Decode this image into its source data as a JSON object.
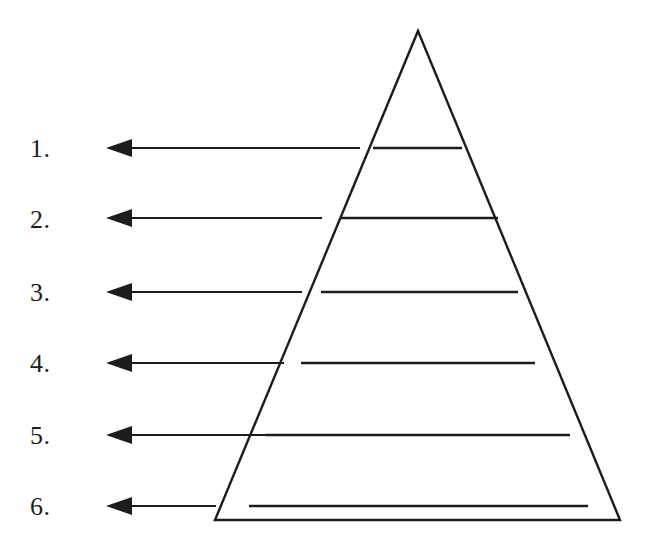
{
  "document": {
    "title": "Pyramid Diagram Worksheet",
    "background_color": "#ffffff",
    "ink_color": "#1d1d1d",
    "width": 654,
    "height": 535
  },
  "diagram": {
    "type": "labeled-pyramid",
    "shape_name": "triangle-pyramid",
    "apex": {
      "x": 418,
      "y": 31
    },
    "base_left": {
      "x": 215,
      "y": 520
    },
    "base_right": {
      "x": 620,
      "y": 520
    },
    "stroke_width": 2.4,
    "tier_count": 6
  },
  "labels": [
    {
      "text": "1.",
      "x": 30,
      "y": 136
    },
    {
      "text": "2.",
      "x": 30,
      "y": 207
    },
    {
      "text": "3.",
      "x": 30,
      "y": 280
    },
    {
      "text": "4.",
      "x": 30,
      "y": 351
    },
    {
      "text": "5.",
      "x": 30,
      "y": 423
    },
    {
      "text": "6.",
      "x": 30,
      "y": 494
    }
  ],
  "arrows": [
    {
      "index": "1",
      "y": 148,
      "tip_x": 106,
      "tail_x": 360,
      "head_width": 26,
      "head_height": 18
    },
    {
      "index": "2",
      "y": 218,
      "tip_x": 106,
      "tail_x": 322,
      "head_width": 26,
      "head_height": 18
    },
    {
      "index": "3",
      "y": 292,
      "tip_x": 106,
      "tail_x": 302,
      "head_width": 26,
      "head_height": 18
    },
    {
      "index": "4",
      "y": 363,
      "tip_x": 106,
      "tail_x": 284,
      "head_width": 26,
      "head_height": 18
    },
    {
      "index": "5",
      "y": 435,
      "tip_x": 106,
      "tail_x": 266,
      "head_width": 26,
      "head_height": 18
    },
    {
      "index": "6",
      "y": 506,
      "tip_x": 106,
      "tail_x": 216,
      "head_width": 26,
      "head_height": 18
    }
  ],
  "tier_dividers": [
    {
      "index": "1",
      "y": 148,
      "x1": 373,
      "x2": 462
    },
    {
      "index": "2",
      "y": 218,
      "x1": 341,
      "x2": 498
    },
    {
      "index": "3",
      "y": 292,
      "x1": 321,
      "x2": 518
    },
    {
      "index": "4",
      "y": 363,
      "x1": 301,
      "x2": 535
    },
    {
      "index": "5",
      "y": 435,
      "x1": 266,
      "x2": 570
    },
    {
      "index": "6",
      "y": 506,
      "x1": 249,
      "x2": 588
    }
  ]
}
